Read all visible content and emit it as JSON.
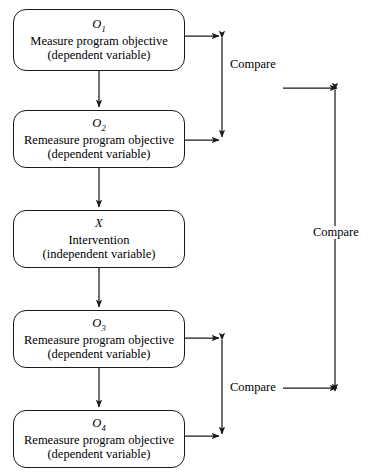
{
  "diagram": {
    "background": "#ffffff",
    "line_color": "#1a1a1a",
    "text_color": "#000000",
    "nodes": [
      {
        "id": "o1",
        "symbol": "O",
        "subscript": "1",
        "line1": "Measure program objective",
        "line2": "(dependent variable)",
        "x": 13,
        "y": 9,
        "w": 172,
        "h": 62
      },
      {
        "id": "o2",
        "symbol": "O",
        "subscript": "2",
        "line1": "Remeasure program objective",
        "line2": "(dependent variable)",
        "x": 13,
        "y": 110,
        "w": 172,
        "h": 58
      },
      {
        "id": "x",
        "symbol": "X",
        "subscript": "",
        "line1": "Intervention",
        "line2": "(independent variable)",
        "x": 13,
        "y": 210,
        "w": 172,
        "h": 58
      },
      {
        "id": "o3",
        "symbol": "O",
        "subscript": "3",
        "line1": "Remeasure program objective",
        "line2": "(dependent variable)",
        "x": 13,
        "y": 310,
        "w": 172,
        "h": 58
      },
      {
        "id": "o4",
        "symbol": "O",
        "subscript": "4",
        "line1": "Remeasure program objective",
        "line2": "(dependent variable)",
        "x": 13,
        "y": 410,
        "w": 172,
        "h": 58
      }
    ],
    "compare_labels": [
      {
        "id": "compare-top",
        "text": "Compare",
        "x": 228,
        "y": 58
      },
      {
        "id": "compare-bottom",
        "text": "Compare",
        "x": 228,
        "y": 381
      },
      {
        "id": "compare-outer",
        "text": "Compare",
        "x": 311,
        "y": 226
      }
    ],
    "flow_sequence": [
      "O1",
      "O2",
      "X",
      "O3",
      "O4"
    ],
    "comparisons": [
      {
        "from": "O1",
        "to": "O2",
        "label": "Compare"
      },
      {
        "from": "O3",
        "to": "O4",
        "label": "Compare"
      },
      {
        "from": "O1-O2 pair",
        "to": "O3-O4 pair",
        "label": "Compare"
      }
    ]
  }
}
